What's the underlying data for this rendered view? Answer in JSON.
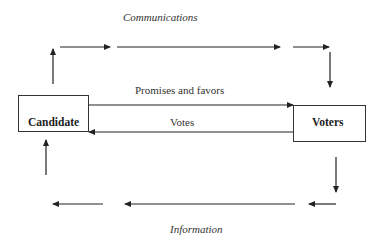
{
  "diagram": {
    "title_top": "Communications",
    "title_bottom": "Information",
    "nodes": {
      "candidate": {
        "label": "Candidate"
      },
      "voters": {
        "label": "Voters"
      }
    },
    "edges": {
      "promises": {
        "label": "Promises and favors",
        "from": "Candidate",
        "to": "Voters"
      },
      "votes": {
        "label": "Votes",
        "from": "Voters",
        "to": "Candidate"
      },
      "communications_loop": {
        "from": "Candidate",
        "to": "Voters",
        "label": "Communications"
      },
      "information_loop": {
        "from": "Voters",
        "to": "Candidate",
        "label": "Information"
      }
    },
    "colors": {
      "line": "#222222",
      "background": "#ffffff"
    }
  }
}
